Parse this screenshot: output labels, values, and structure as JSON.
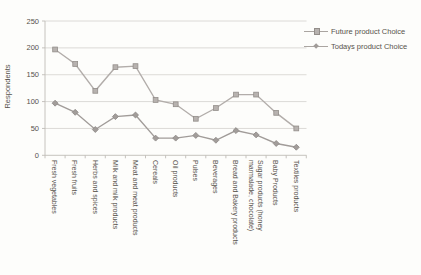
{
  "colors": {
    "background": "#fdfdfb",
    "grid": "#d8d6d2",
    "axis": "#bfbcb7",
    "text": "#57524b",
    "series_future_line": "#b2adaa",
    "series_future_fill": "#b7b2af",
    "series_future_border": "#938e8a",
    "series_today_line": "#a19c99",
    "series_today_fill": "#a29d9a",
    "series_today_border": "#8e8986"
  },
  "chart_data": {
    "type": "line",
    "title": "",
    "xlabel": "",
    "ylabel": "Respondents",
    "ylim": [
      0,
      250
    ],
    "yticks": [
      0,
      50,
      100,
      150,
      200,
      250
    ],
    "grid": "horizontal",
    "legend_position": "top-right",
    "categories": [
      "Fresh vegetables",
      "Fresh fruits",
      "Herbs and spices",
      "Milk and milk products",
      "Meat and meat products",
      "Cereals",
      "Oil products",
      "Pulses",
      "Beverages",
      "Bread and Bakery products",
      "Sugar products (honey\nmarmalade, chocolate)",
      "Baby Products",
      "Textiles products"
    ],
    "series": [
      {
        "name": "Future product Choice",
        "marker": "square",
        "values": [
          197,
          170,
          120,
          164,
          166,
          103,
          95,
          68,
          88,
          113,
          113,
          79,
          50
        ]
      },
      {
        "name": "Todays product Choice",
        "marker": "diamond",
        "values": [
          97,
          80,
          48,
          72,
          75,
          32,
          32,
          37,
          28,
          46,
          38,
          22,
          15
        ]
      }
    ]
  }
}
